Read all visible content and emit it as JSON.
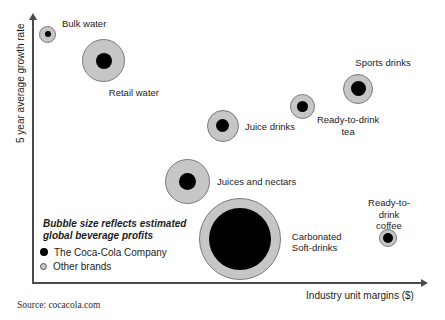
{
  "chart_data": {
    "type": "scatter",
    "mark": "bubble",
    "xlabel": "Industry unit margins ($)",
    "ylabel": "5 year average growth rate",
    "axis_ticks_shown": false,
    "source": "Source: cocacola.com",
    "size_note": {
      "line1": "Bubble size reflects estimated",
      "line2": "global beverage profits"
    },
    "legend": {
      "position": "bottom-left-inside",
      "items": [
        {
          "label": "The Coca-Cola Company",
          "color": "#000000",
          "swatch_border": "#000000"
        },
        {
          "label": "Other brands",
          "color": "#c6c6c6",
          "swatch_border": "#555555"
        }
      ]
    },
    "bubbles": [
      {
        "label": "Bulk water",
        "lines": [
          "Bulk water"
        ],
        "x": 0.038,
        "y": 0.943,
        "outer_r": 8.5,
        "inner_r": 3,
        "label_dx": 14,
        "label_dy": -10,
        "label_align": "left"
      },
      {
        "label": "Retail water",
        "lines": [
          "Retail water"
        ],
        "x": 0.18,
        "y": 0.841,
        "outer_r": 21.5,
        "inner_r": 8,
        "label_dx": 30,
        "label_dy": 32,
        "label_align": "center"
      },
      {
        "label": "Sports drinks",
        "lines": [
          "Sports drinks"
        ],
        "x": 0.825,
        "y": 0.735,
        "outer_r": 15,
        "inner_r": 7.5,
        "label_dx": 25,
        "label_dy": -26,
        "label_align": "center"
      },
      {
        "label": "Ready-to-drink tea",
        "lines": [
          "Ready-to-drink",
          "tea"
        ],
        "x": 0.683,
        "y": 0.67,
        "outer_r": 12.5,
        "inner_r": 5.5,
        "label_dx": 46,
        "label_dy": 19,
        "label_align": "center"
      },
      {
        "label": "Juice drinks",
        "lines": [
          "Juice drinks"
        ],
        "x": 0.482,
        "y": 0.595,
        "outer_r": 16,
        "inner_r": 6.5,
        "label_dx": 22,
        "label_dy": 1,
        "label_align": "left"
      },
      {
        "label": "Juices and nectars",
        "lines": [
          "Juices and nectars"
        ],
        "x": 0.391,
        "y": 0.383,
        "outer_r": 22.5,
        "inner_r": 8.5,
        "label_dx": 30,
        "label_dy": 0,
        "label_align": "left"
      },
      {
        "label": "Carbonated Soft-drinks",
        "lines": [
          "Carbonated",
          "Soft-drinks"
        ],
        "x": 0.525,
        "y": 0.167,
        "outer_r": 41,
        "inner_r": 31,
        "label_dx": 52,
        "label_dy": 3,
        "label_align": "left"
      },
      {
        "label": "Ready-to-drink coffee",
        "lines": [
          "Ready-to-drink",
          "coffee"
        ],
        "x": 0.901,
        "y": 0.17,
        "outer_r": 9,
        "inner_r": 5,
        "label_dx": 1,
        "label_dy": -24,
        "label_align": "center"
      }
    ],
    "colors": {
      "bubble_fill": "#c6c6c6",
      "bubble_border": "#7a7a7a",
      "company_fill": "#000000",
      "axis": "#4a4a4a",
      "text": "#1c1c1c"
    }
  }
}
